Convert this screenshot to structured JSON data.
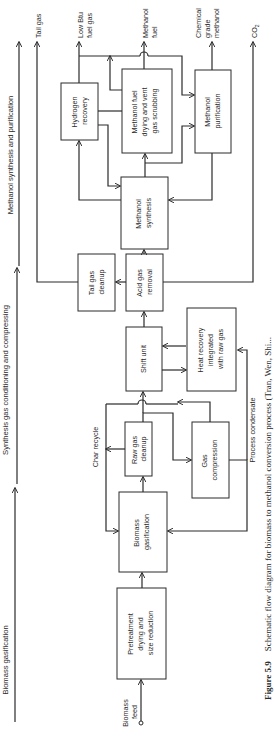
{
  "sections": [
    {
      "label": "Biomass gasification"
    },
    {
      "label": "Synthesis gas conditioning and compressing"
    },
    {
      "label": "Methanol synthesis and purification"
    }
  ],
  "boxes": {
    "pretreatment": [
      "Pretreatment",
      "drying and",
      "size reduction"
    ],
    "gasification": [
      "Biomass",
      "gasification"
    ],
    "raw_gas_cleanup": [
      "Raw gas",
      "cleanup"
    ],
    "gas_compression": [
      "Gas",
      "compression"
    ],
    "shift_unit": [
      "Shift unit"
    ],
    "heat_recovery": [
      "Heat recovery",
      "integrated",
      "with raw gas"
    ],
    "acid_gas_removal": [
      "Acid gas",
      "removal"
    ],
    "tail_gas_cleanup": [
      "Tail gas",
      "cleanup"
    ],
    "methanol_synthesis": [
      "Methanol",
      "synthesis"
    ],
    "hydrogen_recovery": [
      "Hydrogen",
      "recovery"
    ],
    "methanol_fuel_drying": [
      "Methanol fuel",
      "drying and vent",
      "gas scrubbing"
    ],
    "methanol_purification": [
      "Methanol",
      "purification"
    ]
  },
  "streams": {
    "biomass_feed": [
      "Biomass",
      "feed"
    ],
    "char_recycle": "Char recycle",
    "process_condensate": "Process condensate",
    "tail_gas": "Tail gas",
    "low_btu": [
      "Low Btu",
      "fuel gas"
    ],
    "methanol_fuel": [
      "Methanol",
      "fuel"
    ],
    "chemical_grade": [
      "Chemical",
      "grade",
      "methanol"
    ],
    "co2": "CO",
    "co2_sub": "2"
  },
  "caption": {
    "label": "Figure 5.9",
    "text": "Schematic flow diagram for biomass to methanol conversion process (Tran, Wen, Shi..."
  }
}
